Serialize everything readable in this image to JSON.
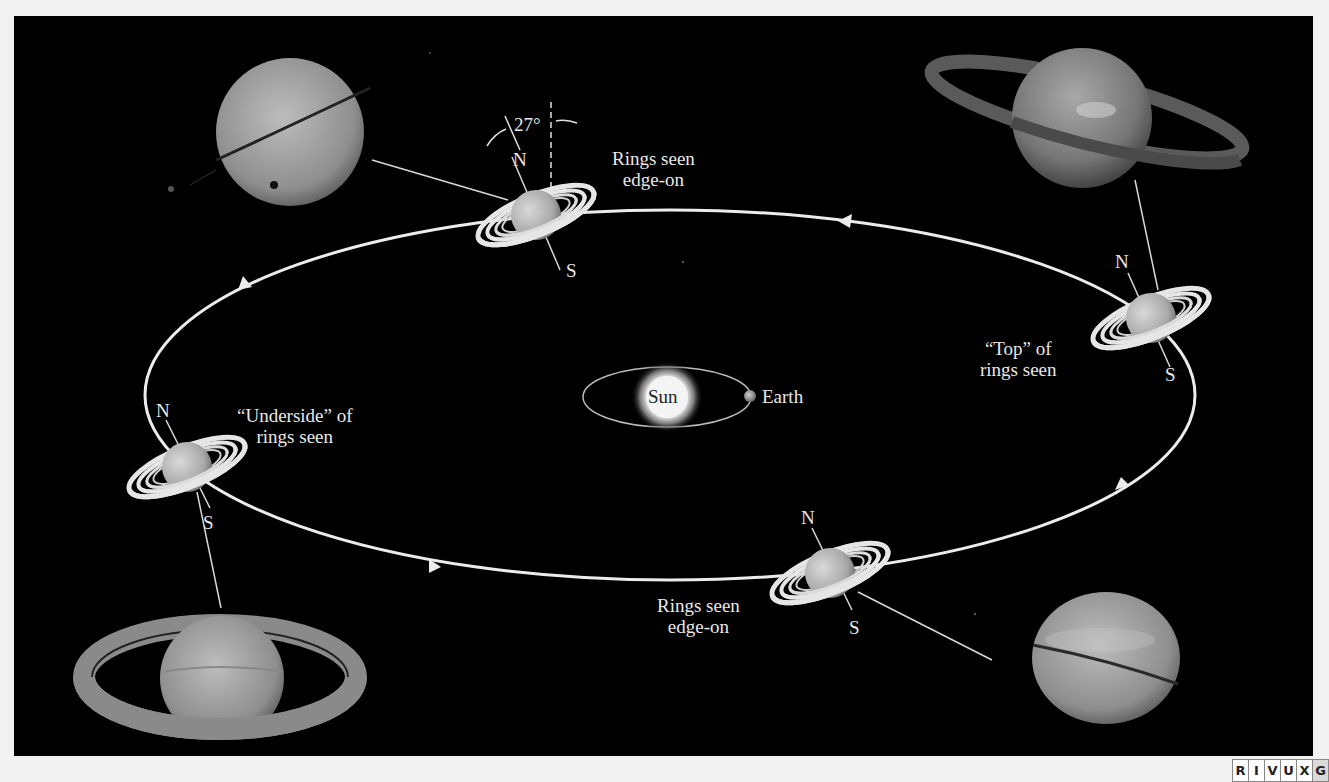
{
  "figure": {
    "background_color": "#000000",
    "page_color": "#f2f2f2",
    "orbit": {
      "center": [
        670,
        395
      ],
      "rx": 525,
      "ry": 185,
      "direction": "counterclockwise",
      "color": "#ececec"
    },
    "sun": {
      "label": "Sun",
      "center": [
        667,
        397
      ],
      "radius": 22
    },
    "earth": {
      "label": "Earth",
      "center": [
        750,
        396
      ]
    },
    "earth_orbit": {
      "center": [
        667,
        397
      ],
      "rx": 84,
      "ry": 30
    },
    "axial_tilt": {
      "label": "27°"
    },
    "positions": [
      {
        "id": "top",
        "center": [
          535,
          215
        ],
        "pole_n": "N",
        "pole_s": "S",
        "label_lines": [
          "Rings seen",
          "edge-on"
        ]
      },
      {
        "id": "right",
        "center": [
          1150,
          318
        ],
        "pole_n": "N",
        "pole_s": "S",
        "label_lines": [
          "“Top” of",
          "rings seen"
        ]
      },
      {
        "id": "bottom",
        "center": [
          830,
          573
        ],
        "pole_n": "N",
        "pole_s": "S",
        "label_lines": [
          "Rings seen",
          "edge-on"
        ]
      },
      {
        "id": "left",
        "center": [
          187,
          467
        ],
        "pole_n": "N",
        "pole_s": "S",
        "label_lines": [
          "“Underside” of",
          "rings seen"
        ]
      }
    ],
    "photos": [
      {
        "id": "photo-edge-on-top",
        "center": [
          290,
          132
        ],
        "description": "Saturn with rings edge-on, moon shadow"
      },
      {
        "id": "photo-top-of-rings",
        "center": [
          1085,
          122
        ],
        "description": "Saturn with top of rings visible"
      },
      {
        "id": "photo-underside-of-rings",
        "center": [
          220,
          680
        ],
        "description": "Saturn with underside of rings visible"
      },
      {
        "id": "photo-edge-on-bottom",
        "center": [
          1105,
          658
        ],
        "description": "Saturn with rings edge-on"
      }
    ]
  },
  "wavelength_band": {
    "letters": [
      "R",
      "I",
      "V",
      "U",
      "X",
      "G"
    ],
    "active": "G"
  }
}
